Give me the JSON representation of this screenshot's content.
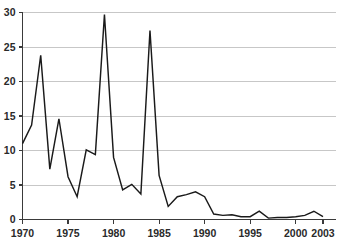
{
  "chart_data": {
    "type": "line",
    "title": "",
    "subtitle": "",
    "xlabel": "",
    "ylabel": "",
    "xlim": [
      1970,
      2003
    ],
    "ylim": [
      0,
      30
    ],
    "grid": "horizontal",
    "legend_position": "none",
    "x_tick_labels": [
      "1970",
      "1975",
      "1980",
      "1985",
      "1990",
      "1995",
      "2000",
      "2003"
    ],
    "x_tick_values": [
      1970,
      1975,
      1980,
      1985,
      1990,
      1995,
      2000,
      2003
    ],
    "y_tick_labels": [
      "0",
      "5",
      "10",
      "15",
      "20",
      "25",
      "30"
    ],
    "y_tick_values": [
      0,
      5,
      10,
      15,
      20,
      25,
      30
    ],
    "x": [
      1970,
      1971,
      1972,
      1973,
      1974,
      1975,
      1976,
      1977,
      1978,
      1979,
      1980,
      1981,
      1982,
      1983,
      1984,
      1985,
      1986,
      1987,
      1988,
      1989,
      1990,
      1991,
      1992,
      1993,
      1994,
      1995,
      1996,
      1997,
      1998,
      1999,
      2000,
      2001,
      2002,
      2003
    ],
    "series": [
      {
        "name": "series-1",
        "color": "#1a1a1a",
        "values": [
          11.0,
          13.7,
          23.8,
          7.3,
          14.6,
          6.2,
          3.3,
          10.1,
          9.4,
          29.7,
          9.0,
          4.3,
          5.1,
          3.7,
          27.4,
          6.4,
          1.9,
          3.3,
          3.6,
          4.0,
          3.3,
          0.8,
          0.6,
          0.7,
          0.4,
          0.4,
          1.2,
          0.2,
          0.3,
          0.3,
          0.4,
          0.6,
          1.2,
          0.4
        ]
      }
    ],
    "annotations": []
  }
}
